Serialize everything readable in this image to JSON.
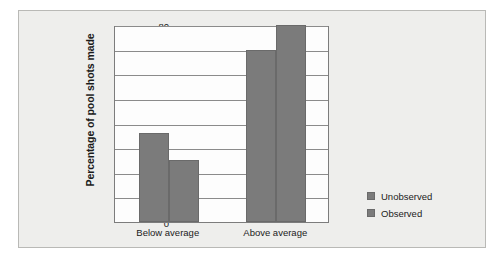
{
  "figure": {
    "background_color": "#eeeeec",
    "border_color": "#b9b9b6",
    "plot_background_color": "#fdfdfd"
  },
  "chart_data": {
    "type": "bar",
    "title": "",
    "subtitle": "",
    "xlabel": "",
    "ylabel": "Percentage of pool shots made",
    "categories": [
      "Below average",
      "Above average"
    ],
    "series": [
      {
        "name": "Unobserved",
        "values": [
          36,
          70
        ],
        "color": "#7b7b7b"
      },
      {
        "name": "Observed",
        "values": [
          25,
          80
        ],
        "color": "#7b7b7b"
      }
    ],
    "ylim": [
      0,
      80
    ],
    "yticks": [
      0,
      10,
      20,
      30,
      40,
      50,
      60,
      70,
      80
    ],
    "ytick_labels": [
      "0",
      "10",
      "20",
      "30",
      "40",
      "50",
      "60",
      "70",
      "80"
    ],
    "grid": true,
    "grid_axis": "y",
    "legend_position": "right",
    "bar_grouping": "grouped"
  }
}
